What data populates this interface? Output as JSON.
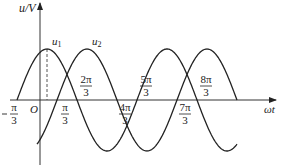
{
  "chart_data": {
    "type": "line",
    "title": "",
    "xlabel": "ωt",
    "ylabel": "u/V",
    "origin_label": "O",
    "x_unit": "π/3",
    "xlim_units_of_pi_over_3": [
      -1.4,
      11.8
    ],
    "ylim": [
      -1.1,
      1.55
    ],
    "grid": false,
    "series": [
      {
        "name": "u1",
        "label": "u",
        "subscript": "1",
        "formula": "sin(ωt + π/3)",
        "amplitude": 1,
        "phase_over_pi": 0.3333,
        "x_range_over_pi": [
          -0.3333,
          3.3333
        ],
        "zero_crossings": [
          "-π/3",
          "2π/3",
          "5π/3",
          "8π/3"
        ]
      },
      {
        "name": "u2",
        "label": "u",
        "subscript": "2",
        "formula": "sin(ωt - π/3)",
        "amplitude": 1,
        "phase_over_pi": -0.3333,
        "x_range_over_pi": [
          0,
          3.3333
        ],
        "zero_crossings": [
          "π/3",
          "4π/3",
          "7π/3",
          "10π/3"
        ]
      }
    ],
    "tick_labels": [
      {
        "num": "π",
        "den": "3",
        "sign": "-",
        "value_over_pi": -0.3333,
        "side": "below"
      },
      {
        "num": "π",
        "den": "3",
        "sign": "",
        "value_over_pi": 0.3333,
        "side": "below"
      },
      {
        "num": "2π",
        "den": "3",
        "sign": "",
        "value_over_pi": 0.6667,
        "side": "above"
      },
      {
        "num": "4π",
        "den": "3",
        "sign": "",
        "value_over_pi": 1.3333,
        "side": "below"
      },
      {
        "num": "5π",
        "den": "3",
        "sign": "",
        "value_over_pi": 1.6667,
        "side": "above"
      },
      {
        "num": "7π",
        "den": "3",
        "sign": "",
        "value_over_pi": 2.3333,
        "side": "below"
      },
      {
        "num": "8π",
        "den": "3",
        "sign": "",
        "value_over_pi": 2.6667,
        "side": "above"
      }
    ],
    "annotations": [
      {
        "type": "dashed-vertical",
        "at_over_pi": 0.1667,
        "description": "peak of u1"
      }
    ]
  }
}
